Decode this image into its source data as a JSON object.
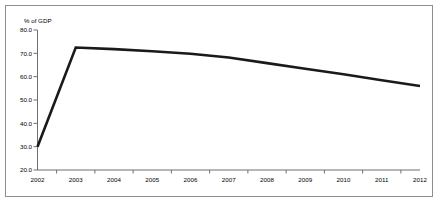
{
  "chart_data": {
    "type": "line",
    "title": "",
    "subtitle": "",
    "xlabel": "",
    "ylabel": "% of GDP",
    "x": [
      2002,
      2003,
      2004,
      2005,
      2006,
      2007,
      2008,
      2009,
      2010,
      2011,
      2012
    ],
    "xtick_labels": [
      "2002",
      "2003",
      "2004",
      "2005",
      "2006",
      "2007",
      "2008",
      "2009",
      "2010",
      "2011",
      "2012"
    ],
    "ytick_labels": [
      "20.0",
      "30.0",
      "40.0",
      "50.0",
      "60.0",
      "70.0",
      "80.0"
    ],
    "ytick_values": [
      20.0,
      30.0,
      40.0,
      50.0,
      60.0,
      70.0,
      80.0
    ],
    "ylim": [
      20.0,
      80.0
    ],
    "xlim": [
      2002,
      2012
    ],
    "grid": false,
    "legend": false,
    "legend_position": "none",
    "series": [
      {
        "name": "% of GDP",
        "color": "#1a1a1a",
        "values": [
          30.0,
          72.5,
          71.8,
          70.9,
          69.8,
          68.2,
          65.8,
          63.4,
          61.0,
          58.5,
          56.0
        ]
      }
    ]
  },
  "colors": {
    "line": "#1a1a1a",
    "axis": "#6f6f6f",
    "frame": "#8d8d8d",
    "background": "#ffffff",
    "text": "#000000"
  }
}
